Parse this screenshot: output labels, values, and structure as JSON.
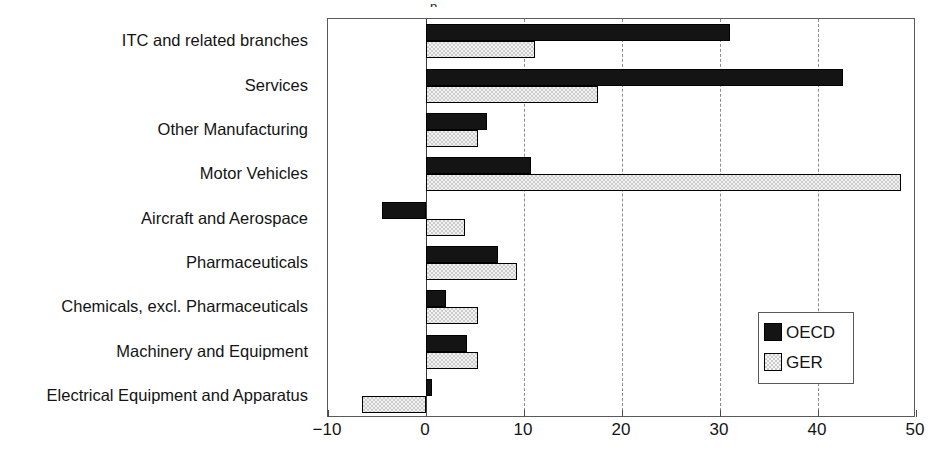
{
  "chart_data": {
    "type": "bar",
    "orientation": "horizontal",
    "title": "",
    "title_fragment": "p",
    "xlabel": "",
    "ylabel": "",
    "xlim": [
      -10,
      50
    ],
    "xticks": [
      -10,
      0,
      10,
      20,
      30,
      40,
      50
    ],
    "xticklabels": [
      "−10",
      "0",
      "10",
      "20",
      "30",
      "40",
      "50"
    ],
    "grid": "vertical-dashed",
    "gridlines_at": [
      10,
      20,
      30,
      40
    ],
    "zero_line_at": 0,
    "legend_position": "lower-right-inside",
    "categories": [
      "ITC and related branches",
      "Services",
      "Other Manufacturing",
      "Motor Vehicles",
      "Aircraft and Aerospace",
      "Pharmaceuticals",
      "Chemicals, excl. Pharmaceuticals",
      "Machinery and Equipment",
      "Electrical Equipment and Apparatus"
    ],
    "series": [
      {
        "name": "OECD",
        "color": "#141414",
        "fill": "solid-black",
        "values": [
          31.0,
          42.5,
          6.2,
          10.7,
          -4.5,
          7.3,
          2.0,
          4.2,
          0.6
        ]
      },
      {
        "name": "GER",
        "color": "#cccccc",
        "fill": "light-checkered",
        "values": [
          11.1,
          17.5,
          5.3,
          48.5,
          4.0,
          9.3,
          5.3,
          5.3,
          -6.5
        ]
      }
    ]
  },
  "legend": {
    "entries": [
      {
        "label": "OECD",
        "swatch": "solid-black-swatch"
      },
      {
        "label": "GER",
        "swatch": "checkered-gray-swatch"
      }
    ]
  }
}
